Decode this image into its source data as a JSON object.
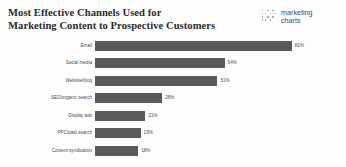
{
  "header": {
    "title_line_1": "Most Effective Channels Used for",
    "title_line_2": "Marketing Content to Prospective Customers",
    "logo": {
      "line_1": "marketing",
      "line_2": "charts",
      "dots_icon": "dot-grid-icon"
    }
  },
  "colors": {
    "bar": "#595959",
    "text": "#4d4d4d",
    "title": "#2b2b2b",
    "background": "#fdfdfd"
  },
  "chart_data": {
    "type": "bar",
    "orientation": "horizontal",
    "title": "Most Effective Channels Used for Marketing Content to Prospective Customers",
    "xlabel": "",
    "ylabel": "",
    "xlim": [
      0,
      100
    ],
    "grid": false,
    "legend": "none",
    "value_suffix": "%",
    "categories": [
      "Email",
      "Social media",
      "Website/blog",
      "SEO/organic search",
      "Display ads",
      "PPC/paid search",
      "Content syndication"
    ],
    "values": [
      82,
      54,
      51,
      28,
      21,
      19,
      18
    ],
    "value_labels": [
      "82%",
      "54%",
      "51%",
      "28%",
      "21%",
      "19%",
      "18%"
    ]
  }
}
